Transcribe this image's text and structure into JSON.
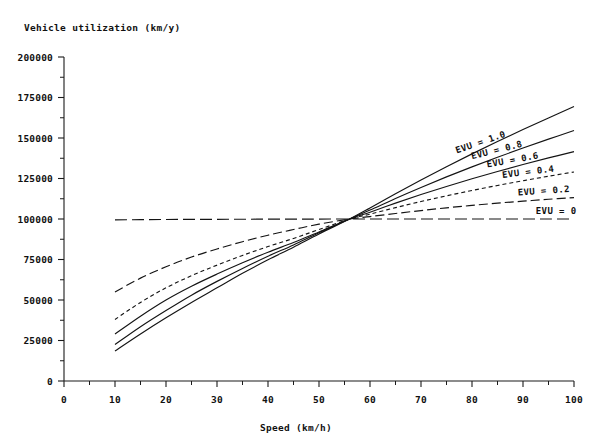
{
  "chart_data": {
    "type": "line",
    "title": "",
    "xlabel": "Speed (km/h)",
    "ylabel": "Vehicle utilization (km/y)",
    "xlim": [
      0,
      100
    ],
    "ylim": [
      0,
      200000
    ],
    "xticks": [
      0,
      10,
      20,
      30,
      40,
      50,
      60,
      70,
      80,
      90,
      100
    ],
    "xticklabels": [
      "0",
      "10",
      "20",
      "30",
      "40",
      "50",
      "60",
      "70",
      "80",
      "90",
      "100"
    ],
    "yticks": [
      0,
      25000,
      50000,
      75000,
      100000,
      125000,
      150000,
      175000,
      200000
    ],
    "yticklabels": [
      "0",
      "25000",
      "50000",
      "75000",
      "100000",
      "125000",
      "150000",
      "175000",
      "200000"
    ],
    "minor_tick_interval_x": 5,
    "minor_tick_interval_y": 12500,
    "grid": false,
    "legend_position": "inline-right-of-curves",
    "convergence_point": {
      "x": 56,
      "y": 100000
    },
    "x": [
      10,
      15,
      20,
      25,
      30,
      35,
      40,
      45,
      50,
      56,
      60,
      65,
      70,
      75,
      80,
      85,
      90,
      95,
      100
    ],
    "series": [
      {
        "name": "EVU = 0",
        "label": "EVU = 0",
        "linestyle": "long-dash",
        "dasharray": "12 5",
        "label_rotation": 0,
        "values": [
          99500,
          99600,
          99700,
          99750,
          99800,
          99850,
          99900,
          99930,
          99960,
          100000,
          100000,
          100000,
          100000,
          100000,
          100000,
          100000,
          100000,
          100000,
          100000
        ]
      },
      {
        "name": "EVU = 0.2",
        "label": "EVU = 0.2",
        "linestyle": "dash",
        "dasharray": "9 4",
        "label_rotation": -4,
        "values": [
          55000,
          63500,
          70500,
          76500,
          81500,
          86000,
          90000,
          93500,
          96800,
          100000,
          101500,
          103400,
          105200,
          106900,
          108400,
          109800,
          111000,
          112200,
          113200
        ]
      },
      {
        "name": "EVU = 0.4",
        "label": "EVU = 0.4",
        "linestyle": "short-dash",
        "dasharray": "4 3",
        "label_rotation": -7,
        "values": [
          38000,
          48500,
          57500,
          65000,
          71500,
          77500,
          83000,
          88000,
          93500,
          100000,
          103000,
          107000,
          110800,
          114300,
          117600,
          120700,
          123600,
          126400,
          129000
        ]
      },
      {
        "name": "EVU = 0.6",
        "label": "EVU = 0.6",
        "linestyle": "solid",
        "dasharray": "",
        "label_rotation": -10,
        "values": [
          29000,
          40000,
          50000,
          58500,
          66000,
          73000,
          79500,
          85500,
          92000,
          100000,
          104200,
          109800,
          115100,
          120100,
          124800,
          129300,
          133600,
          137700,
          141600
        ]
      },
      {
        "name": "EVU = 0.8",
        "label": "EVU = 0.8",
        "linestyle": "solid",
        "dasharray": "",
        "label_rotation": -14,
        "values": [
          22500,
          33500,
          43500,
          53000,
          61500,
          69500,
          77000,
          84000,
          91500,
          100000,
          105500,
          112700,
          119500,
          126000,
          132200,
          138100,
          143800,
          149300,
          154600
        ]
      },
      {
        "name": "EVU = 1.0",
        "label": "EVU = 1.0",
        "linestyle": "solid",
        "dasharray": "",
        "label_rotation": -19,
        "values": [
          18500,
          29000,
          39000,
          48500,
          57500,
          66500,
          74800,
          82600,
          90800,
          100000,
          106800,
          115600,
          124100,
          132300,
          140200,
          147800,
          155200,
          162400,
          169400
        ]
      }
    ]
  },
  "labels": {
    "y_axis_title": "Vehicle utilization (km/y)",
    "x_axis_title": "Speed (km/h)"
  }
}
